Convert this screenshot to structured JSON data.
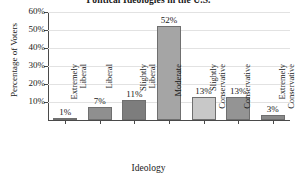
{
  "chart_data": {
    "type": "bar",
    "title": "Political Ideologies in the U.S.",
    "xlabel": "Ideology",
    "ylabel": "Percentage of Voters",
    "categories": [
      "Extremely Liberal",
      "Liberal",
      "Slightly Liberal",
      "Moderate",
      "Slightly Conservative",
      "Conservative",
      "Extremely Conservative"
    ],
    "category_lines": [
      [
        "Extremely",
        "Liberal"
      ],
      [
        "Liberal"
      ],
      [
        "Slightly",
        "Liberal"
      ],
      [
        "Moderate"
      ],
      [
        "Slightly",
        "Conservative"
      ],
      [
        "Conservative"
      ],
      [
        "Extremely",
        "Conservative"
      ]
    ],
    "values": [
      1,
      7,
      11,
      52,
      13,
      13,
      3
    ],
    "value_labels": [
      "1%",
      "7%",
      "11%",
      "52%",
      "13%",
      "13%",
      "3%"
    ],
    "bar_colors": [
      "#b9b9b9",
      "#8f8f8f",
      "#7d7d7d",
      "#a5a5a5",
      "#c8c8c8",
      "#949494",
      "#8a8a8a"
    ],
    "bar_border_color": "#6f6f6f",
    "ylim": [
      0,
      60
    ],
    "yticks": [
      10,
      20,
      30,
      40,
      50,
      60
    ],
    "ytick_labels": [
      "10%",
      "20%",
      "30%",
      "40%",
      "50%",
      "60%"
    ],
    "grid": true,
    "grid_color": "#e2e2e2",
    "axis_color": "#4a4a4a",
    "legend": null,
    "background": "#ffffff"
  }
}
